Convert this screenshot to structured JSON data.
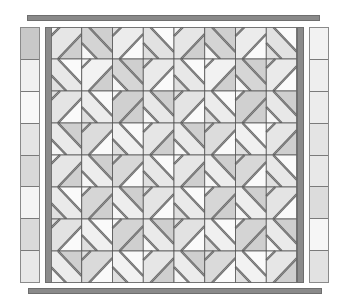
{
  "diagram": {
    "type": "quilt-layout",
    "colors": {
      "bar": "#8a8a8a",
      "bar_outline": "#6e6e6e",
      "stripe": "#8c8c8c",
      "grid_line": "#555555",
      "diag_line": "#6a6a6a",
      "band_light": "#eeeeee"
    },
    "top_border": {
      "x": 27,
      "y": 15,
      "w": 293,
      "h": 6
    },
    "bottom_border": {
      "x": 28,
      "y": 288,
      "w": 294,
      "h": 6
    },
    "left_column": {
      "x": 20,
      "y": 27,
      "w": 20,
      "h": 256,
      "squares": [
        "#c8c8c8",
        "#f0f0f0",
        "#f8f8f8",
        "#e4e4e4",
        "#d8d8d8",
        "#f4f4f4",
        "#dadada",
        "#e8e8e8"
      ]
    },
    "right_column": {
      "x": 309,
      "y": 27,
      "w": 20,
      "h": 256,
      "squares": [
        "#f2f2f2",
        "#eeeeee",
        "#ececec",
        "#e4e4e4",
        "#e8e8e8",
        "#dcdcdc",
        "#f6f6f6",
        "#e2e2e2"
      ]
    },
    "left_stripe": {
      "x": 45,
      "y": 27,
      "w": 7,
      "h": 256
    },
    "right_stripe": {
      "x": 297,
      "y": 27,
      "w": 7,
      "h": 256
    },
    "grid": {
      "x": 51,
      "y": 27,
      "cols": 8,
      "rows": 8,
      "cell_w": 30.75,
      "cell_h": 32,
      "orientation_rule": "(row+col) even => '/', odd => '\\'",
      "cell_shades": [
        [
          "#e6e6e6",
          "#d4d4d4",
          "#ececec",
          "#e2e2e2",
          "#e6e6e6",
          "#d4d4d4",
          "#ececec",
          "#e2e2e2"
        ],
        [
          "#e8e8e8",
          "#f2f2f2",
          "#d6d6d6",
          "#eaeaea",
          "#e8e8e8",
          "#f2f2f2",
          "#d6d6d6",
          "#eaeaea"
        ],
        [
          "#e4e4e4",
          "#ececec",
          "#d0d0d0",
          "#e8e8e8",
          "#e4e4e4",
          "#ececec",
          "#d0d0d0",
          "#e8e8e8"
        ],
        [
          "#eaeaea",
          "#dcdcdc",
          "#f0f0f0",
          "#e6e6e6",
          "#eaeaea",
          "#dcdcdc",
          "#f0f0f0",
          "#e6e6e6"
        ],
        [
          "#e6e6e6",
          "#ededed",
          "#d8d8d8",
          "#e8e8e8",
          "#e6e6e6",
          "#ededed",
          "#d8d8d8",
          "#e8e8e8"
        ],
        [
          "#eaeaea",
          "#d6d6d6",
          "#eeeeee",
          "#e4e4e4",
          "#eaeaea",
          "#d6d6d6",
          "#eeeeee",
          "#e4e4e4"
        ],
        [
          "#e2e2e2",
          "#f0f0f0",
          "#d4d4d4",
          "#eaeaea",
          "#e2e2e2",
          "#f0f0f0",
          "#d4d4d4",
          "#eaeaea"
        ],
        [
          "#ececec",
          "#dadada",
          "#f2f2f2",
          "#e6e6e6",
          "#ececec",
          "#dadada",
          "#f2f2f2",
          "#e6e6e6"
        ]
      ],
      "corner_shades": [
        "#f6f6f6",
        "#cfcfcf",
        "#e0e0e0",
        "#fafafa"
      ]
    }
  }
}
